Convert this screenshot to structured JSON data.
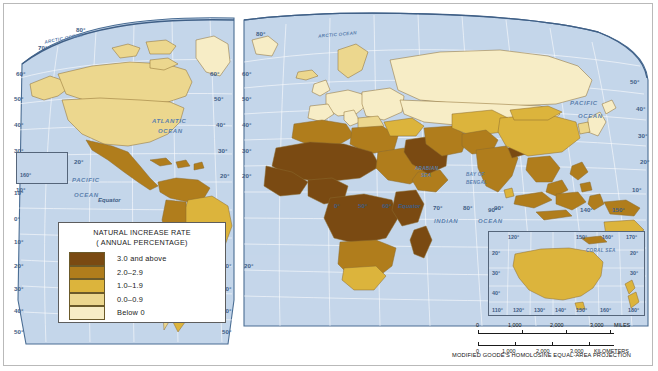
{
  "map": {
    "title": "World Natural Increase Rate",
    "projection_note": "MODIFIED GOODE'S HOMOLOSINE EQUAL-AREA PROJECTION",
    "ocean_color": "#c5d6ea",
    "graticule_color": "#ffffff",
    "coast_color": "#4a6d93",
    "border_color": "#8a6a2f"
  },
  "legend": {
    "title_line1": "NATURAL INCREASE RATE",
    "title_line2": "( ANNUAL PERCENTAGE)",
    "classes": [
      {
        "label": "3.0 and above",
        "color": "#7a4a12"
      },
      {
        "label": "2.0–2.9",
        "color": "#b07d1c"
      },
      {
        "label": "1.0–1.9",
        "color": "#dcb43c"
      },
      {
        "label": "0.0–0.9",
        "color": "#ecd78e"
      },
      {
        "label": "Below 0",
        "color": "#f7edc6"
      }
    ]
  },
  "ocean_labels": [
    {
      "name": "ARCTIC OCEAN",
      "id": "arctic-ocean-west"
    },
    {
      "name": "ARCTIC OCEAN",
      "id": "arctic-ocean-east"
    },
    {
      "name": "ATLANTIC",
      "id": "atlantic-ocean-line1"
    },
    {
      "name": "OCEAN",
      "id": "atlantic-ocean-line2"
    },
    {
      "name": "PACIFIC",
      "id": "pacific-ocean-west-line1"
    },
    {
      "name": "OCEAN",
      "id": "pacific-ocean-west-line2"
    },
    {
      "name": "PACIFIC",
      "id": "pacific-ocean-east-line1"
    },
    {
      "name": "OCEAN",
      "id": "pacific-ocean-east-line2"
    },
    {
      "name": "INDIAN",
      "id": "indian-ocean-line1"
    },
    {
      "name": "OCEAN",
      "id": "indian-ocean-line2"
    },
    {
      "name": "ARABIAN",
      "id": "arabian-sea-line1"
    },
    {
      "name": "SEA",
      "id": "arabian-sea-line2"
    },
    {
      "name": "BAY OF",
      "id": "bay-of-bengal-line1"
    },
    {
      "name": "BENGAL",
      "id": "bay-of-bengal-line2"
    },
    {
      "name": "CORAL SEA",
      "id": "coral-sea"
    }
  ],
  "equator_labels": [
    "Equator",
    "Equator"
  ],
  "graticule_labels": {
    "left_edge": [
      "60°",
      "50°",
      "40°",
      "30°",
      "20°",
      "10°",
      "0°",
      "10°",
      "20°",
      "30°",
      "40°",
      "50°"
    ],
    "right_edge": [
      "50°",
      "40°",
      "30°",
      "20°",
      "10°",
      "20°",
      "30°",
      "40°",
      "50°"
    ],
    "arctic_west": [
      "80°",
      "70°",
      "60°",
      "50°"
    ],
    "arctic_east": [
      "80°",
      "70°",
      "60°",
      "50°"
    ],
    "hawaii_inset": [
      "160°",
      "20°",
      "10°"
    ],
    "equator_row": [
      "0°",
      "50°",
      "60°",
      "70°",
      "80°",
      "90°"
    ],
    "southeast": [
      "90°",
      "140°",
      "150°",
      "10°"
    ],
    "south_america": [
      "20°",
      "30°",
      "40°",
      "50°"
    ]
  },
  "australia_inset": {
    "top_lon": [
      "120°",
      "150°",
      "160°",
      "170°"
    ],
    "bottom_lon": [
      "110°",
      "120°",
      "130°",
      "140°",
      "150°",
      "160°",
      "180°"
    ],
    "left_lat": [
      "20°",
      "30°",
      "40°"
    ],
    "right_lat": [
      "20°",
      "30°"
    ],
    "sea_label": "CORAL SEA"
  },
  "scale_bar": {
    "miles": {
      "ticks": [
        "0",
        "1,000",
        "2,000",
        "3,000"
      ],
      "unit": "MILES"
    },
    "kilometers": {
      "ticks": [
        "0",
        "1,000",
        "2,000",
        "3,000"
      ],
      "unit": "KILOMETERS"
    }
  }
}
